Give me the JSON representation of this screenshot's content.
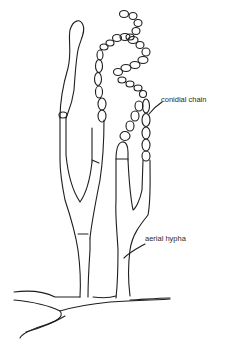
{
  "figure": {
    "type": "biological-illustration",
    "labels": [
      {
        "id": "conidial-chain",
        "text": "conidial chain"
      },
      {
        "id": "aerial-hypha",
        "text": "aerial hypha"
      }
    ],
    "colors": {
      "line": "#1e1e1e",
      "background": "#ffffff",
      "text": "#2a2a2a"
    }
  }
}
